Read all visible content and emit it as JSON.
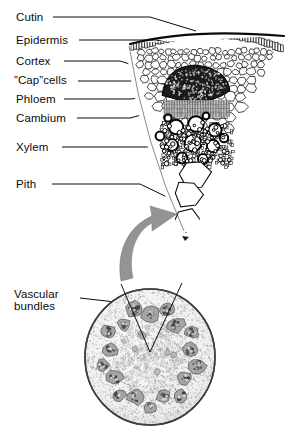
{
  "figure": {
    "kind": "botanical-diagram",
    "background_color": "#ffffff",
    "ink_color": "#0b0b0b",
    "arrow_color": "#8f8f8f"
  },
  "labels": {
    "cutin": "Cutin",
    "epidermis": "Epidermis",
    "cortex": "Cortex",
    "cap_cells_pre": "”",
    "cap_cells_word": "Cap",
    "cap_cells_post": "”cells",
    "cap_cells_full": "”Cap”cells",
    "phloem": "Phloem",
    "cambium": "Cambium",
    "xylem": "Xylem",
    "pith": "Pith",
    "vascular_bundles_line1": "Vascular",
    "vascular_bundles_line2": "bundles"
  },
  "label_positions": {
    "cutin": {
      "x": 16,
      "y": 17,
      "leader_x1": 53,
      "leader_y1": 22,
      "leader_x2": 163,
      "leader_y2": 34
    },
    "epidermis": {
      "x": 16,
      "y": 40,
      "leader_x1": 77,
      "leader_y1": 45,
      "leader_x2": 160,
      "leader_y2": 52
    },
    "cortex": {
      "x": 16,
      "y": 61,
      "leader_x1": 62,
      "leader_y1": 66,
      "leader_x2": 140,
      "leader_y2": 72
    },
    "cap_cells": {
      "x": 14,
      "y": 79,
      "leader_x1": 76,
      "leader_y1": 85,
      "leader_x2": 166,
      "leader_y2": 79
    },
    "phloem": {
      "x": 16,
      "y": 98,
      "leader_x1": 62,
      "leader_y1": 103,
      "leader_x2": 160,
      "leader_y2": 101
    },
    "cambium": {
      "x": 16,
      "y": 117,
      "leader_x1": 75,
      "leader_y1": 122,
      "leader_x2": 163,
      "leader_y2": 112
    },
    "xylem": {
      "x": 16,
      "y": 146,
      "leader_x1": 60,
      "leader_y1": 151,
      "leader_x2": 172,
      "leader_y2": 132
    },
    "pith": {
      "x": 16,
      "y": 183,
      "leader_x1": 50,
      "leader_y1": 188,
      "leader_x2": 178,
      "leader_y2": 211
    },
    "vascular": {
      "x": 14,
      "y": 292,
      "leader_x1": 78,
      "leader_y1": 303,
      "leader_x2": 150,
      "leader_y2": 320
    }
  },
  "wedge": {
    "name": "magnified-vascular-bundle-wedge",
    "apex_x": 186,
    "apex_y": 232,
    "top_left_x": 131,
    "top_left_y": 43,
    "top_right_x": 284,
    "top_right_y": 36,
    "regions": {
      "cuticle": "dark outer line",
      "epidermis": "single row of small rectangular cells",
      "cortex": "rounded parenchyma cells",
      "cap_cells": "dark sclerenchyma cap",
      "phloem": "gray striped band",
      "cambium": "thin band below phloem",
      "xylem": "large round vessels with thick walls",
      "pith": "large polygonal cells toward apex"
    }
  },
  "cross_section": {
    "name": "whole-stem-cross-section",
    "center_x": 150,
    "center_y": 357,
    "radius_x": 65,
    "radius_y": 68,
    "bundle_count": 18,
    "wedge_marker": {
      "apex_x": 150,
      "apex_y": 351,
      "left_x": 121,
      "left_y": 284,
      "right_x": 182,
      "right_y": 283
    }
  },
  "magnify_arrow": {
    "name": "magnification-arrow",
    "from_x": 131,
    "from_y": 276,
    "to_x": 176,
    "to_y": 212,
    "color": "#8f8f8f"
  }
}
